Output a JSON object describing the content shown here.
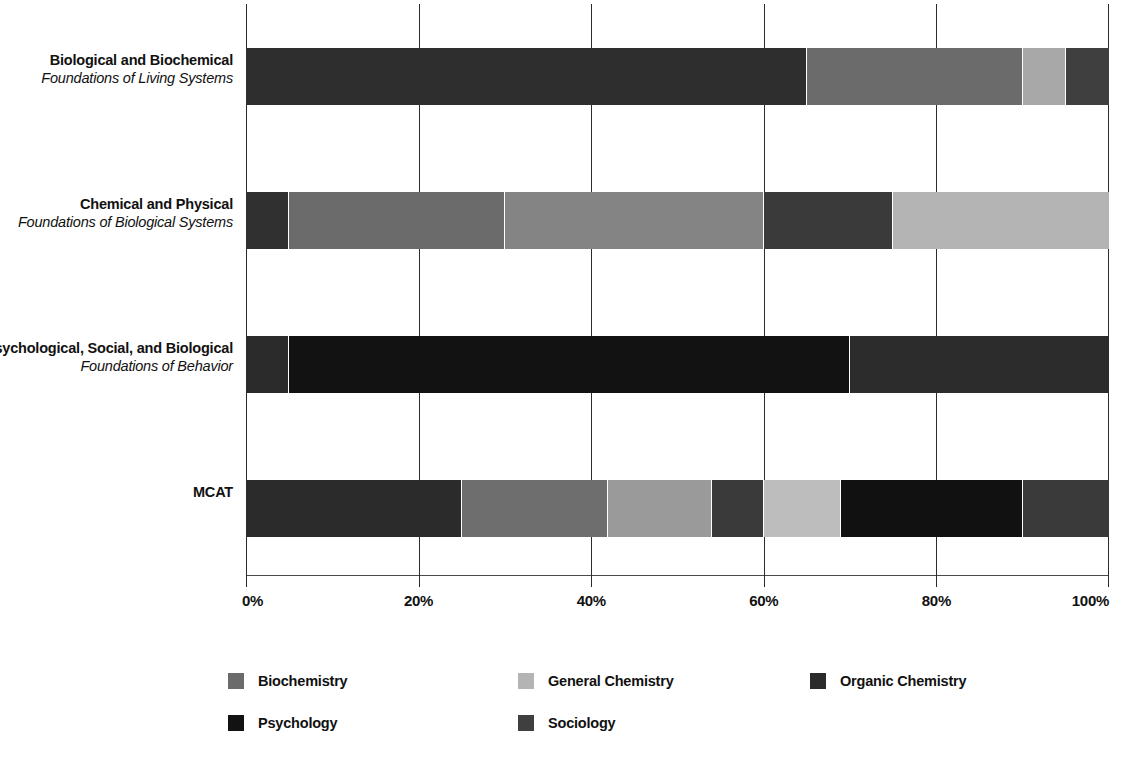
{
  "chart_data": {
    "type": "bar",
    "orientation": "horizontal",
    "stacked": true,
    "normalized": true,
    "title": "",
    "subtitle": "",
    "xlabel": "",
    "ylabel": "",
    "xlim": [
      0,
      100
    ],
    "grid": true,
    "legend_position": "bottom",
    "x_tick_labels": [
      "0%",
      "20%",
      "40%",
      "60%",
      "80%",
      "100%"
    ],
    "x_tick_values": [
      0,
      20,
      40,
      60,
      80,
      100
    ],
    "categories": [
      {
        "line1": "Biological and Biochemical",
        "line2": "Foundations of Living Systems"
      },
      {
        "line1": "Chemical and Physical",
        "line2": "Foundations of Biological Systems"
      },
      {
        "line1": "Psychological, Social, and Biological",
        "line2": "Foundations of Behavior"
      },
      {
        "line1": "MCAT",
        "line2": ""
      }
    ],
    "series": [
      {
        "name": "Biochemistry",
        "color": "#595959",
        "values": [
          25,
          25,
          5,
          25
        ]
      },
      {
        "name": "General Chemistry",
        "color": "#a6a6a6",
        "values": [
          5,
          45,
          0,
          17
        ]
      },
      {
        "name": "Organic Chemistry",
        "color": "#262626",
        "values": [
          5,
          30,
          0,
          12
        ]
      },
      {
        "name": "Psychology",
        "color": "#0d0d0d",
        "values": [
          0,
          0,
          65,
          21
        ]
      },
      {
        "name": "Sociology",
        "color": "#404040",
        "values": [
          65,
          0,
          30,
          25
        ]
      }
    ],
    "bars": [
      {
        "category": "Biological and Biochemical Foundations of Living Systems",
        "segments": [
          {
            "series": "Sociology",
            "start": 0,
            "value": 65,
            "color": "#2e2e2e"
          },
          {
            "series": "Biochemistry",
            "start": 65,
            "value": 25,
            "color": "#6b6b6b"
          },
          {
            "series": "General Chemistry",
            "start": 90,
            "value": 5,
            "color": "#a8a8a8"
          },
          {
            "series": "Organic Chemistry",
            "start": 95,
            "value": 5,
            "color": "#3f3f3f"
          }
        ]
      },
      {
        "category": "Chemical and Physical Foundations of Biological Systems",
        "segments": [
          {
            "series": "Organic Chemistry",
            "start": 0,
            "value": 5,
            "color": "#303030"
          },
          {
            "series": "Biochemistry",
            "start": 5,
            "value": 25,
            "color": "#6b6b6b"
          },
          {
            "series": "Sociology",
            "start": 30,
            "value": 30,
            "color": "#848484"
          },
          {
            "series": "Organic Chemistry",
            "start": 60,
            "value": 15,
            "color": "#3a3a3a"
          },
          {
            "series": "General Chemistry",
            "start": 75,
            "value": 25,
            "color": "#b4b4b4"
          }
        ]
      },
      {
        "category": "Psychological, Social, and Biological Foundations of Behavior",
        "segments": [
          {
            "series": "Biochemistry",
            "start": 0,
            "value": 5,
            "color": "#2b2b2b"
          },
          {
            "series": "Psychology",
            "start": 5,
            "value": 65,
            "color": "#121212"
          },
          {
            "series": "Sociology",
            "start": 70,
            "value": 30,
            "color": "#2c2c2c"
          }
        ]
      },
      {
        "category": "MCAT",
        "segments": [
          {
            "series": "Biochemistry",
            "start": 0,
            "value": 25,
            "color": "#2b2b2b"
          },
          {
            "series": "Sociology",
            "start": 25,
            "value": 17,
            "color": "#6e6e6e"
          },
          {
            "series": "General Chemistry",
            "start": 42,
            "value": 12,
            "color": "#9a9a9a"
          },
          {
            "series": "Organic Chemistry",
            "start": 54,
            "value": 6,
            "color": "#3a3a3a"
          },
          {
            "series": "General Chemistry",
            "start": 60,
            "value": 9,
            "color": "#bdbdbd"
          },
          {
            "series": "Psychology",
            "start": 69,
            "value": 21,
            "color": "#111111"
          },
          {
            "series": "Sociology",
            "start": 90,
            "value": 10,
            "color": "#3a3a3a"
          }
        ]
      }
    ],
    "legend": [
      {
        "label": "Biochemistry",
        "color": "#6b6b6b"
      },
      {
        "label": "General Chemistry",
        "color": "#b4b4b4"
      },
      {
        "label": "Organic Chemistry",
        "color": "#2b2b2b"
      },
      {
        "label": "Psychology",
        "color": "#121212"
      },
      {
        "label": "Sociology",
        "color": "#3f3f3f"
      }
    ]
  }
}
